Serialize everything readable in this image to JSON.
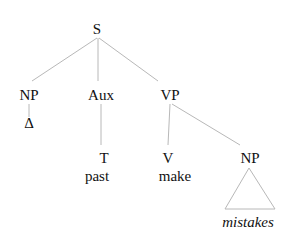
{
  "diagram": {
    "type": "syntax-tree",
    "nodes": [
      {
        "id": "S",
        "label": "S"
      },
      {
        "id": "NP1",
        "label": "NP"
      },
      {
        "id": "Aux",
        "label": "Aux"
      },
      {
        "id": "VP",
        "label": "VP"
      },
      {
        "id": "delta",
        "label": "Δ"
      },
      {
        "id": "T",
        "label": "T"
      },
      {
        "id": "past",
        "label": "past"
      },
      {
        "id": "V",
        "label": "V"
      },
      {
        "id": "make",
        "label": "make"
      },
      {
        "id": "NP2",
        "label": "NP"
      },
      {
        "id": "mistakes",
        "label": "mistakes",
        "italic": true
      }
    ],
    "edges": [
      {
        "from": "S",
        "to": "NP1"
      },
      {
        "from": "S",
        "to": "Aux"
      },
      {
        "from": "S",
        "to": "VP"
      },
      {
        "from": "NP1",
        "to": "delta"
      },
      {
        "from": "Aux",
        "to": "T"
      },
      {
        "from": "VP",
        "to": "V"
      },
      {
        "from": "VP",
        "to": "NP2"
      },
      {
        "from": "NP2",
        "to": "mistakes",
        "style": "triangle"
      }
    ]
  }
}
